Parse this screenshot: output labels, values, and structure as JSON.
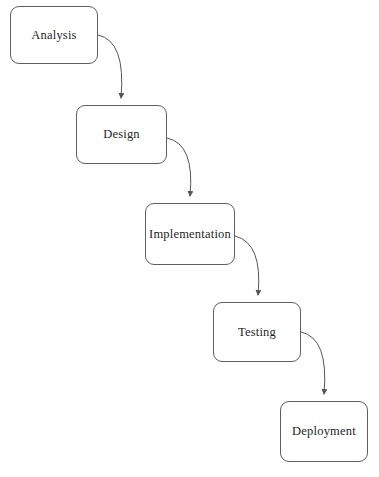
{
  "diagram": {
    "type": "flowchart",
    "title": "",
    "nodes": [
      {
        "id": "analysis",
        "label": "Analysis"
      },
      {
        "id": "design",
        "label": "Design"
      },
      {
        "id": "implementation",
        "label": "Implementation"
      },
      {
        "id": "testing",
        "label": "Testing"
      },
      {
        "id": "deployment",
        "label": "Deployment"
      }
    ],
    "edges": [
      {
        "from": "Analysis",
        "to": "Design"
      },
      {
        "from": "Design",
        "to": "Implementation"
      },
      {
        "from": "Implementation",
        "to": "Testing"
      },
      {
        "from": "Testing",
        "to": "Deployment"
      }
    ],
    "colors": {
      "background": "#ffffff",
      "node_border": "#5f5f5f",
      "node_fill": "#ffffff",
      "text": "#1f1f1f",
      "arrow": "#555555"
    }
  }
}
